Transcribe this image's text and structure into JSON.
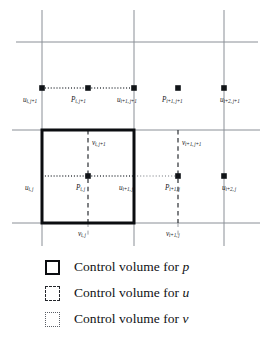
{
  "figure": {
    "type": "staggered-grid-diagram",
    "geometry": {
      "width": 266,
      "height": 250,
      "vertical_gridlines_x": [
        42,
        134,
        224
      ],
      "horizontal_gridlines_y": [
        42,
        130,
        223
      ],
      "u_centerlines_y": [
        88,
        176
      ],
      "v_centerlines_x": [
        88,
        178
      ],
      "p_control_volume": {
        "x0": 42,
        "y0": 130,
        "x1": 134,
        "y1": 223
      },
      "u_control_volume": {
        "x0": 42,
        "y0": 42,
        "x1": 134,
        "y1": 130
      },
      "v_control_volume": {
        "x0": 88,
        "y0": 130,
        "x1": 178,
        "y1": 223
      }
    },
    "colors": {
      "gridline": "#8a8f96",
      "bold_outline": "#0b0d10",
      "dashed_line": "#2a2d32",
      "dotted_line": "#4a4f56",
      "node": "#111418",
      "background": "#ffffff"
    },
    "nodes": [
      {
        "name": "u_i_j+1",
        "x": 42,
        "y": 88,
        "symbol": "u"
      },
      {
        "name": "P_i_j+1",
        "x": 88,
        "y": 88,
        "symbol": "P"
      },
      {
        "name": "u_i+1_j+1",
        "x": 134,
        "y": 88,
        "symbol": "u"
      },
      {
        "name": "P_i+1_j+1",
        "x": 178,
        "y": 88,
        "symbol": "P"
      },
      {
        "name": "u_i+2_j+1",
        "x": 224,
        "y": 88,
        "symbol": "u"
      },
      {
        "name": "u_i_j",
        "x": 42,
        "y": 176,
        "symbol": "u"
      },
      {
        "name": "P_i_j",
        "x": 88,
        "y": 176,
        "symbol": "P"
      },
      {
        "name": "u_i+1_j",
        "x": 134,
        "y": 176,
        "symbol": "u"
      },
      {
        "name": "P_i+1_j",
        "x": 178,
        "y": 176,
        "symbol": "P"
      },
      {
        "name": "u_i+2_j",
        "x": 224,
        "y": 176,
        "symbol": "u"
      }
    ],
    "labels": [
      {
        "id": "u-i-j1",
        "base": "u",
        "sub": "i, j+1",
        "x": 23,
        "y": 97
      },
      {
        "id": "p-i-j1",
        "base": "P",
        "sub": "i, j+1",
        "x": 72,
        "y": 97
      },
      {
        "id": "u-i1-j1",
        "base": "u",
        "sub": "i+1, j+1",
        "x": 118,
        "y": 97
      },
      {
        "id": "p-i1-j1",
        "base": "P",
        "sub": "i+1, j+1",
        "x": 163,
        "y": 97
      },
      {
        "id": "u-i2-j1",
        "base": "u",
        "sub": "i+2, j+1",
        "x": 220,
        "y": 97
      },
      {
        "id": "v-i-j1",
        "base": "v",
        "sub": "i, j+1",
        "x": 92,
        "y": 141
      },
      {
        "id": "v-i1-j1",
        "base": "v",
        "sub": "i+1, j+1",
        "x": 182,
        "y": 141
      },
      {
        "id": "u-i-j",
        "base": "u",
        "sub": "i, j",
        "x": 25,
        "y": 185
      },
      {
        "id": "p-i-j",
        "base": "P",
        "sub": "i, j",
        "x": 76,
        "y": 185
      },
      {
        "id": "u-i1-j",
        "base": "u",
        "sub": "i+1, j",
        "x": 120,
        "y": 185
      },
      {
        "id": "p-i1-j",
        "base": "P",
        "sub": "i+1, j",
        "x": 166,
        "y": 185
      },
      {
        "id": "u-i2-j",
        "base": "u",
        "sub": "i+2, j",
        "x": 222,
        "y": 185
      },
      {
        "id": "v-i-j",
        "base": "v",
        "sub": "i, j",
        "x": 78,
        "y": 232
      },
      {
        "id": "v-i1-j",
        "base": "v",
        "sub": "i+1, j",
        "x": 166,
        "y": 232
      }
    ]
  },
  "legend": {
    "items": [
      {
        "swatch": "solid",
        "prefix": "Control volume for ",
        "symbol": "p"
      },
      {
        "swatch": "dashed",
        "prefix": "Control volume for ",
        "symbol": "u"
      },
      {
        "swatch": "dotted",
        "prefix": "Control volume for ",
        "symbol": "v"
      }
    ]
  }
}
